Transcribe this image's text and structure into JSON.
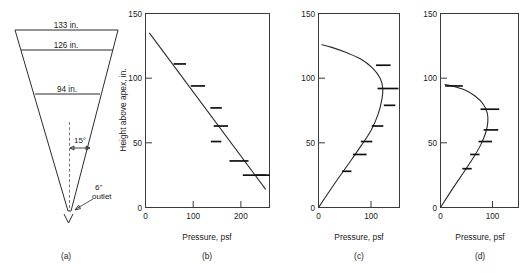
{
  "figure": {
    "panels": [
      "(a)",
      "(b)",
      "(c)",
      "(d)"
    ],
    "axis_titles": {
      "x": "Pressure, psf",
      "y": "Height above apex, in."
    }
  },
  "schematic": {
    "label": "(a)",
    "name": "hopper-cross-section",
    "dimensions": [
      {
        "id": "top-width",
        "text": "133 in.",
        "height_in": 133
      },
      {
        "id": "second-width",
        "text": "126 in.",
        "height_in": 126
      },
      {
        "id": "third-width",
        "text": "94 in.",
        "height_in": 94
      }
    ],
    "angle": {
      "text": "15°",
      "value_deg": 15
    },
    "outlet": {
      "text_line1": "6\"",
      "text_line2": "outlet",
      "size_in": 6
    }
  },
  "chart_data": [
    {
      "type": "line",
      "panel": "(b)",
      "title": "",
      "xlabel": "Pressure, psf",
      "ylabel": "Height above apex, in.",
      "xlim": [
        0,
        260
      ],
      "ylim": [
        0,
        150
      ],
      "xticks": [
        0,
        100,
        200
      ],
      "xtick_labels": [
        "0",
        "100",
        "200"
      ],
      "yticks": [
        0,
        50,
        100,
        150
      ],
      "ytick_labels": [
        "0",
        "50",
        "100",
        "150"
      ],
      "grid": false,
      "legend": false,
      "series": [
        {
          "name": "theoretical-line",
          "kind": "line",
          "x": [
            8,
            252
          ],
          "y": [
            135,
            14
          ]
        },
        {
          "name": "measured-data",
          "kind": "horizontal-tick-markers",
          "points": [
            {
              "x": 72,
              "y": 111,
              "half_width": 13
            },
            {
              "x": 110,
              "y": 94,
              "half_width": 15
            },
            {
              "x": 148,
              "y": 77,
              "half_width": 12
            },
            {
              "x": 158,
              "y": 63,
              "half_width": 15
            },
            {
              "x": 148,
              "y": 51,
              "half_width": 11
            },
            {
              "x": 196,
              "y": 36,
              "half_width": 20
            },
            {
              "x": 228,
              "y": 25,
              "half_width": 24
            },
            {
              "x": 246,
              "y": 25,
              "half_width": 14
            }
          ]
        }
      ]
    },
    {
      "type": "line",
      "panel": "(c)",
      "title": "",
      "xlabel": "Pressure, psf",
      "ylabel": "Height above apex, in.",
      "xlim": [
        0,
        155
      ],
      "ylim": [
        0,
        150
      ],
      "xticks": [
        0,
        100
      ],
      "xtick_labels": [
        "0",
        "100"
      ],
      "yticks": [
        0,
        50,
        100,
        150
      ],
      "ytick_labels": [
        "0",
        "50",
        "100",
        "150"
      ],
      "grid": false,
      "legend": false,
      "series": [
        {
          "name": "theoretical-curve",
          "kind": "curve",
          "x": [
            0,
            30,
            58,
            82,
            101,
            114,
            121,
            123,
            118,
            103,
            80,
            52,
            24,
            6
          ],
          "y": [
            0,
            18,
            34,
            48,
            60,
            72,
            83,
            92,
            100,
            108,
            115,
            120,
            124,
            126
          ]
        },
        {
          "name": "measured-data",
          "kind": "horizontal-tick-markers",
          "points": [
            {
              "x": 54,
              "y": 28,
              "half_width": 9
            },
            {
              "x": 79,
              "y": 41,
              "half_width": 13
            },
            {
              "x": 92,
              "y": 51,
              "half_width": 11
            },
            {
              "x": 113,
              "y": 63,
              "half_width": 11
            },
            {
              "x": 136,
              "y": 79,
              "half_width": 11
            },
            {
              "x": 133,
              "y": 92,
              "half_width": 20
            },
            {
              "x": 124,
              "y": 110,
              "half_width": 14
            }
          ]
        }
      ]
    },
    {
      "type": "line",
      "panel": "(d)",
      "title": "",
      "xlabel": "Pressure, psf",
      "ylabel": "Height above apex, in.",
      "xlim": [
        0,
        150
      ],
      "ylim": [
        0,
        150
      ],
      "xticks": [
        0,
        100
      ],
      "xtick_labels": [
        "0",
        "100"
      ],
      "yticks": [
        0,
        50,
        100,
        150
      ],
      "ytick_labels": [
        "0",
        "50",
        "100",
        "150"
      ],
      "grid": false,
      "legend": false,
      "series": [
        {
          "name": "theoretical-curve",
          "kind": "curve",
          "x": [
            0,
            24,
            46,
            64,
            78,
            87,
            91,
            90,
            82,
            67,
            46,
            22,
            8
          ],
          "y": [
            0,
            15,
            28,
            39,
            49,
            58,
            66,
            73,
            80,
            86,
            91,
            94,
            95
          ]
        },
        {
          "name": "measured-data",
          "kind": "horizontal-tick-markers",
          "points": [
            {
              "x": 51,
              "y": 30,
              "half_width": 9
            },
            {
              "x": 66,
              "y": 41,
              "half_width": 9
            },
            {
              "x": 86,
              "y": 51,
              "half_width": 13
            },
            {
              "x": 97,
              "y": 60,
              "half_width": 14
            },
            {
              "x": 95,
              "y": 76,
              "half_width": 18
            },
            {
              "x": 26,
              "y": 94,
              "half_width": 17
            }
          ]
        }
      ]
    }
  ]
}
